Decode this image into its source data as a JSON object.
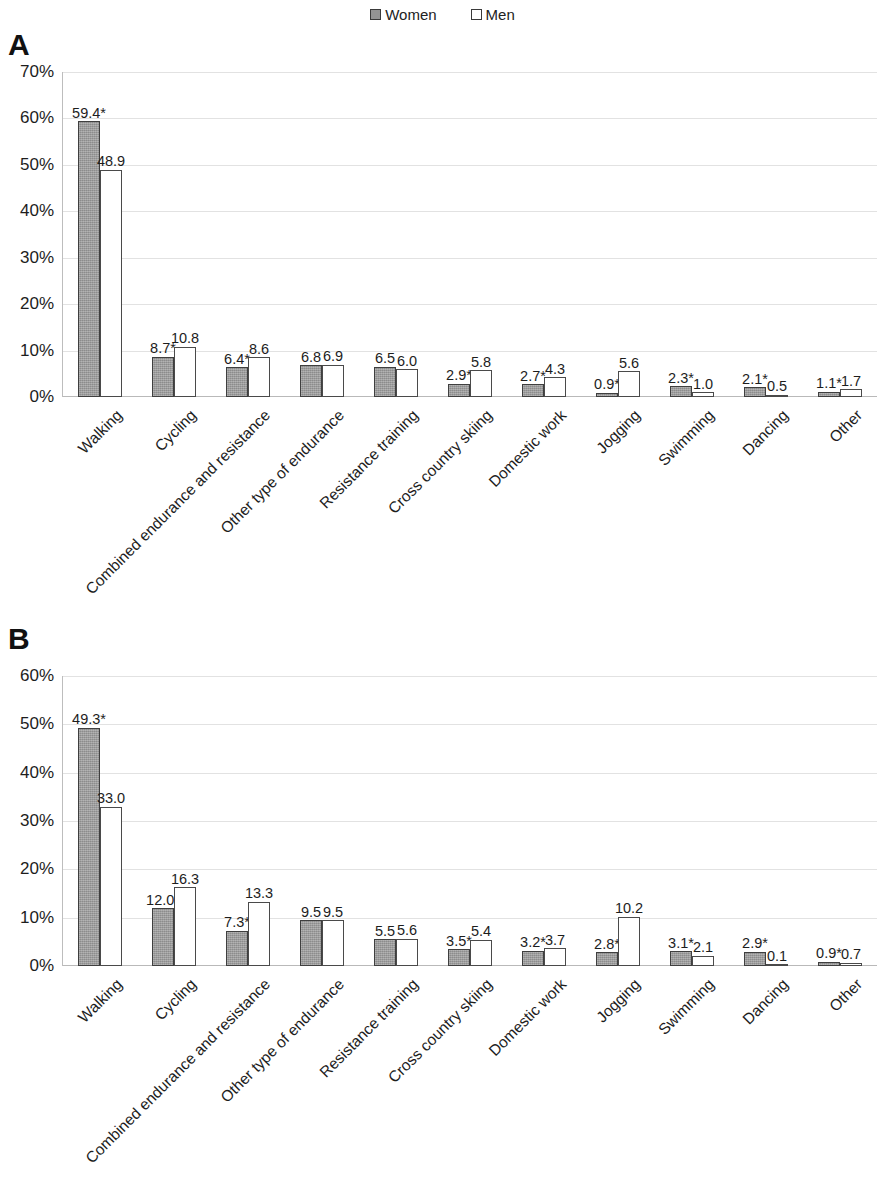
{
  "legend": {
    "entries": [
      {
        "label": "Women",
        "swatch": "filled-gray-square",
        "color": "#949494"
      },
      {
        "label": "Men",
        "swatch": "open-white-square",
        "color": "#ffffff"
      }
    ]
  },
  "panels": [
    {
      "letter": "A"
    },
    {
      "letter": "B"
    }
  ],
  "chart_data": [
    {
      "type": "bar",
      "panel": "A",
      "title": "A",
      "xlabel": "",
      "ylabel": "",
      "ylim": [
        0,
        70
      ],
      "ytick_labels": [
        "0%",
        "10%",
        "20%",
        "30%",
        "40%",
        "50%",
        "60%",
        "70%"
      ],
      "ytick_values": [
        0,
        10,
        20,
        30,
        40,
        50,
        60,
        70
      ],
      "grid": true,
      "legend_position": "top-center",
      "categories": [
        "Walking",
        "Cycling",
        "Combined endurance and resistance",
        "Other type of endurance",
        "Resistance training",
        "Cross country skiing",
        "Domestic work",
        "Jogging",
        "Swimming",
        "Dancing",
        "Other"
      ],
      "series": [
        {
          "name": "Women",
          "values": [
            59.4,
            8.7,
            6.4,
            6.8,
            6.5,
            2.9,
            2.7,
            0.9,
            2.3,
            2.1,
            1.1
          ],
          "labels": [
            "59.4*",
            "8.7*",
            "6.4*",
            "6.8",
            "6.5",
            "2.9*",
            "2.7*",
            "0.9*",
            "2.3*",
            "2.1*",
            "1.1*"
          ]
        },
        {
          "name": "Men",
          "values": [
            48.9,
            10.8,
            8.6,
            6.9,
            6.0,
            5.8,
            4.3,
            5.6,
            1.0,
            0.5,
            1.7
          ],
          "labels": [
            "48.9",
            "10.8",
            "8.6",
            "6.9",
            "6.0",
            "5.8",
            "4.3",
            "5.6",
            "1.0",
            "0.5",
            "1.7"
          ]
        }
      ]
    },
    {
      "type": "bar",
      "panel": "B",
      "title": "B",
      "xlabel": "",
      "ylabel": "",
      "ylim": [
        0,
        60
      ],
      "ytick_labels": [
        "0%",
        "10%",
        "20%",
        "30%",
        "40%",
        "50%",
        "60%"
      ],
      "ytick_values": [
        0,
        10,
        20,
        30,
        40,
        50,
        60
      ],
      "grid": true,
      "legend_position": "top-center",
      "categories": [
        "Walking",
        "Cycling",
        "Combined endurance and resistance",
        "Other type of endurance",
        "Resistance training",
        "Cross country skiing",
        "Domestic work",
        "Jogging",
        "Swimming",
        "Dancing",
        "Other"
      ],
      "series": [
        {
          "name": "Women",
          "values": [
            49.3,
            12.0,
            7.3,
            9.5,
            5.5,
            3.5,
            3.2,
            2.8,
            3.1,
            2.9,
            0.9
          ],
          "labels": [
            "49.3*",
            "12.0*",
            "7.3*",
            "9.5",
            "5.5",
            "3.5*",
            "3.2*",
            "2.8*",
            "3.1*",
            "2.9*",
            "0.9*"
          ]
        },
        {
          "name": "Men",
          "values": [
            33.0,
            16.3,
            13.3,
            9.5,
            5.6,
            5.4,
            3.7,
            10.2,
            2.1,
            0.1,
            0.7
          ],
          "labels": [
            "33.0",
            "16.3",
            "13.3",
            "9.5",
            "5.6",
            "5.4",
            "3.7",
            "10.2",
            "2.1",
            "0.1",
            "0.7"
          ]
        }
      ]
    }
  ]
}
